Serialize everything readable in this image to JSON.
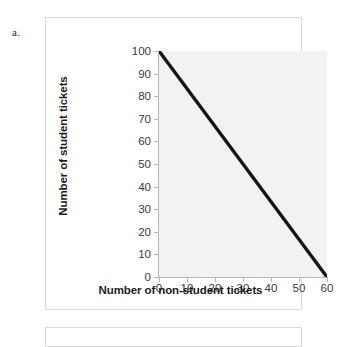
{
  "item_label": "a.",
  "chart_data": {
    "type": "line",
    "title": "",
    "xlabel": "Number of non-student tickets",
    "ylabel": "Number of student tickets",
    "xlim": [
      0,
      60
    ],
    "ylim": [
      0,
      100
    ],
    "xticks": [
      0,
      10,
      20,
      30,
      40,
      50,
      60
    ],
    "yticks": [
      0,
      10,
      20,
      30,
      40,
      50,
      60,
      70,
      80,
      90,
      100
    ],
    "grid": false,
    "legend": "none",
    "plot_background": "#f2f2f2",
    "series": [
      {
        "name": "budget constraint",
        "color": "#141414",
        "line_width": 3,
        "x": [
          0,
          60
        ],
        "values": [
          100,
          0
        ]
      }
    ],
    "annotations": []
  },
  "axis": {
    "x_tick_labels": [
      "0",
      "10",
      "20",
      "30",
      "40",
      "50",
      "60"
    ],
    "y_tick_labels": [
      "100",
      "90",
      "80",
      "70",
      "60",
      "50",
      "40",
      "30",
      "20",
      "10",
      "0"
    ],
    "x_title": "Number of non-student tickets",
    "y_title": "Number of student tickets"
  }
}
